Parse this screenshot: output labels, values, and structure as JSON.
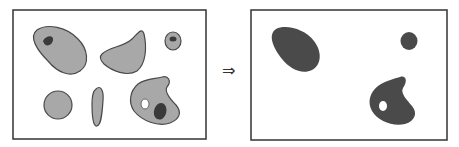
{
  "figure": {
    "arrow": "⇒",
    "left_panel": {
      "description": "Input image with seven gray blobs; some contain dark or white holes",
      "colors": {
        "border": "#333333",
        "blob_fill": "#a8a8a8",
        "blob_stroke": "#4a4a4a",
        "hole_dark": "#3a3a3a",
        "hole_light": "#ffffff"
      }
    },
    "right_panel": {
      "description": "Output image retaining only the three blobs that contained dark regions, filled dark",
      "colors": {
        "border": "#333333",
        "blob_fill": "#4a4a4a"
      }
    }
  }
}
